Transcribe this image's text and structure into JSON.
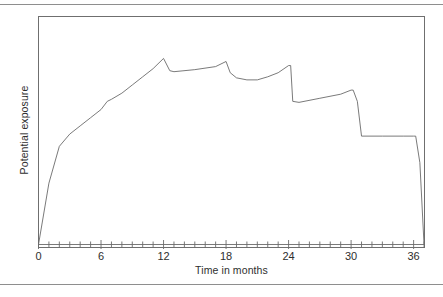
{
  "chart_data": {
    "type": "line",
    "title": "",
    "xlabel": "Time in months",
    "ylabel": "Potential exposure",
    "xlim": [
      0,
      37.2
    ],
    "ylim": [
      0,
      100
    ],
    "grid": false,
    "legend": null,
    "xticks_major": [
      0,
      6,
      12,
      18,
      24,
      30,
      36
    ],
    "xticks_major_labels": [
      "0",
      "6",
      "12",
      "18",
      "24",
      "30",
      "36"
    ],
    "xticks_minor_step": 1,
    "series": [
      {
        "name": "Potential exposure",
        "x": [
          0,
          1,
          2,
          3,
          4,
          5,
          6,
          6.6,
          7,
          8,
          9,
          10,
          11,
          12,
          12.6,
          13,
          15,
          17,
          18,
          18.4,
          19,
          20,
          21,
          22,
          23,
          24,
          24.2,
          24.4,
          25,
          27,
          29,
          30,
          30.2,
          30.6,
          31,
          33,
          35,
          36,
          36.2,
          36.6,
          37
        ],
        "y": [
          0,
          30,
          48,
          54,
          58,
          62,
          66,
          70,
          71,
          74,
          78,
          82,
          86,
          91,
          85,
          84.5,
          85.5,
          87,
          89.5,
          84,
          81.5,
          80.5,
          80.5,
          82,
          84,
          87.5,
          87.5,
          70,
          69.5,
          71.5,
          73.5,
          75.5,
          75.5,
          70,
          53,
          53,
          53,
          53,
          53,
          40,
          0
        ]
      }
    ],
    "annotations": []
  },
  "axis": {
    "x_tick_labels": [
      {
        "value": "0",
        "x": 0
      },
      {
        "value": "6",
        "x": 6
      },
      {
        "value": "12",
        "x": 12
      },
      {
        "value": "18",
        "x": 18
      },
      {
        "value": "24",
        "x": 24
      },
      {
        "value": "30",
        "x": 30
      },
      {
        "value": "36",
        "x": 36
      }
    ]
  },
  "colors": {
    "line": "#6b6b6b",
    "frame": "#6f6f6f",
    "rule": "#8e8e8e",
    "text": "#2e2e2e",
    "background": "#ffffff"
  }
}
